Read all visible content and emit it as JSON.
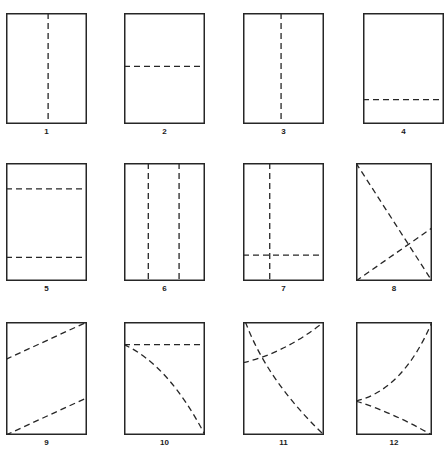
{
  "sheet": {
    "title": "Fold-line pattern figure sheet",
    "background_color": "#ffffff",
    "stroke_color": "#262626",
    "dash_color": "#262626",
    "columns": 4,
    "rows": 3,
    "panel_count": 12
  },
  "panels": [
    {
      "label": "1",
      "description": "Rectangle with one vertical dashed fold line near the middle",
      "x": 6,
      "y": 13,
      "w": 81,
      "h": 111,
      "marks": [
        {
          "kind": "line",
          "x1": 0.52,
          "y1": 0.0,
          "x2": 0.52,
          "y2": 1.0
        }
      ]
    },
    {
      "label": "2",
      "description": "Rectangle with one horizontal dashed fold line near the middle",
      "x": 124,
      "y": 13,
      "w": 81,
      "h": 111,
      "marks": [
        {
          "kind": "line",
          "x1": 0.0,
          "y1": 0.48,
          "x2": 1.0,
          "y2": 0.48
        }
      ]
    },
    {
      "label": "3",
      "description": "Rectangle with one vertical dashed fold line left of middle",
      "x": 243,
      "y": 13,
      "w": 81,
      "h": 111,
      "marks": [
        {
          "kind": "line",
          "x1": 0.47,
          "y1": 0.0,
          "x2": 0.47,
          "y2": 1.0
        }
      ]
    },
    {
      "label": "4",
      "description": "Rectangle with one horizontal dashed fold line near the bottom",
      "x": 363,
      "y": 13,
      "w": 81,
      "h": 111,
      "marks": [
        {
          "kind": "line",
          "x1": 0.0,
          "y1": 0.78,
          "x2": 1.0,
          "y2": 0.78
        }
      ]
    },
    {
      "label": "5",
      "description": "Rectangle with two horizontal dashed fold lines splitting it in thirds",
      "x": 6,
      "y": 163,
      "w": 81,
      "h": 118,
      "marks": [
        {
          "kind": "line",
          "x1": 0.0,
          "y1": 0.22,
          "x2": 1.0,
          "y2": 0.22
        },
        {
          "kind": "line",
          "x1": 0.0,
          "y1": 0.8,
          "x2": 1.0,
          "y2": 0.8
        }
      ]
    },
    {
      "label": "6",
      "description": "Rectangle with two vertical dashed fold lines splitting it in thirds",
      "x": 124,
      "y": 163,
      "w": 81,
      "h": 118,
      "marks": [
        {
          "kind": "line",
          "x1": 0.3,
          "y1": 0.0,
          "x2": 0.3,
          "y2": 1.0
        },
        {
          "kind": "line",
          "x1": 0.68,
          "y1": 0.0,
          "x2": 0.68,
          "y2": 1.0
        }
      ]
    },
    {
      "label": "7",
      "description": "Rectangle with a vertical dashed line and a horizontal dashed line crossing near the lower left",
      "x": 243,
      "y": 163,
      "w": 81,
      "h": 118,
      "marks": [
        {
          "kind": "line",
          "x1": 0.33,
          "y1": 0.0,
          "x2": 0.33,
          "y2": 1.0
        },
        {
          "kind": "line",
          "x1": 0.0,
          "y1": 0.78,
          "x2": 1.0,
          "y2": 0.78
        }
      ]
    },
    {
      "label": "8",
      "description": "Rectangle with two crossing dashed diagonals forming an X",
      "x": 356,
      "y": 163,
      "w": 76,
      "h": 118,
      "marks": [
        {
          "kind": "line",
          "x1": 0.0,
          "y1": 0.0,
          "x2": 1.0,
          "y2": 1.0
        },
        {
          "kind": "line",
          "x1": 0.0,
          "y1": 1.0,
          "x2": 1.0,
          "y2": 0.55
        }
      ]
    },
    {
      "label": "9",
      "description": "Rectangle with two parallel dashed diagonals",
      "x": 6,
      "y": 322,
      "w": 81,
      "h": 113,
      "marks": [
        {
          "kind": "line",
          "x1": 0.0,
          "y1": 0.33,
          "x2": 1.0,
          "y2": 0.0
        },
        {
          "kind": "line",
          "x1": 0.0,
          "y1": 1.0,
          "x2": 1.0,
          "y2": 0.67
        }
      ]
    },
    {
      "label": "10",
      "description": "Rectangle with a horizontal dashed line near the top and a dashed curve sweeping from it down to the bottom right corner",
      "x": 124,
      "y": 322,
      "w": 81,
      "h": 113,
      "marks": [
        {
          "kind": "line",
          "x1": 0.0,
          "y1": 0.2,
          "x2": 1.0,
          "y2": 0.2
        },
        {
          "kind": "curve",
          "x1": 0.0,
          "y1": 0.2,
          "cx": 0.55,
          "cy": 0.38,
          "x2": 1.0,
          "y2": 1.0
        }
      ]
    },
    {
      "label": "11",
      "description": "Rectangle with two crossing dashed curves",
      "x": 243,
      "y": 322,
      "w": 81,
      "h": 113,
      "marks": [
        {
          "kind": "curve",
          "x1": 0.03,
          "y1": 0.0,
          "cx": 0.3,
          "cy": 0.52,
          "x2": 1.0,
          "y2": 1.0
        },
        {
          "kind": "curve",
          "x1": 0.0,
          "y1": 0.36,
          "cx": 0.5,
          "cy": 0.28,
          "x2": 1.0,
          "y2": 0.0
        }
      ]
    },
    {
      "label": "12",
      "description": "Rectangle with two dashed curves meeting on the left edge, one rising to the top right corner and one falling to the bottom right corner",
      "x": 356,
      "y": 322,
      "w": 76,
      "h": 113,
      "marks": [
        {
          "kind": "curve",
          "x1": 0.0,
          "y1": 0.7,
          "cx": 0.62,
          "cy": 0.6,
          "x2": 1.0,
          "y2": 0.0
        },
        {
          "kind": "curve",
          "x1": 0.0,
          "y1": 0.7,
          "cx": 0.48,
          "cy": 0.8,
          "x2": 1.0,
          "y2": 1.0
        }
      ]
    }
  ]
}
